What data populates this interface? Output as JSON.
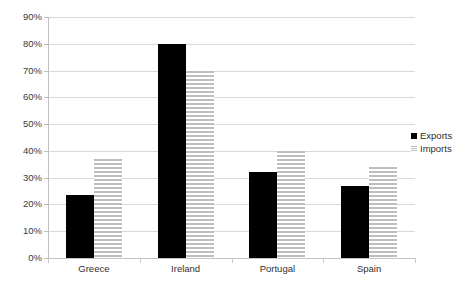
{
  "chart_data": {
    "type": "bar",
    "title": "",
    "subtitle": "",
    "xlabel": "",
    "ylabel": "",
    "categories": [
      "Greece",
      "Ireland",
      "Portugal",
      "Spain"
    ],
    "series": [
      {
        "name": "Exports",
        "color": "#000000",
        "values": [
          23.7,
          80.0,
          32.3,
          27.0
        ]
      },
      {
        "name": "Imports",
        "color": "#bdbdbd",
        "values": [
          37.0,
          70.0,
          40.0,
          34.0
        ]
      }
    ],
    "ylim": [
      0,
      90
    ],
    "ytick_values": [
      0,
      10,
      20,
      30,
      40,
      50,
      60,
      70,
      80,
      90
    ],
    "ytick_labels": [
      "0%",
      "10%",
      "20%",
      "30%",
      "40%",
      "50%",
      "60%",
      "70%",
      "80%",
      "90%"
    ],
    "grid": true,
    "legend_position": "right",
    "legend": [
      "Exports",
      "Imports"
    ]
  }
}
